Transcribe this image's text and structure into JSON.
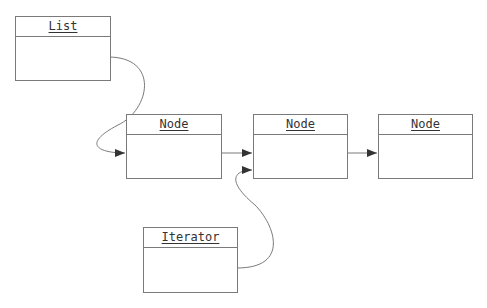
{
  "diagram": {
    "boxes": [
      {
        "id": "list",
        "title": "List"
      },
      {
        "id": "node1",
        "title": "Node"
      },
      {
        "id": "node2",
        "title": "Node"
      },
      {
        "id": "node3",
        "title": "Node"
      },
      {
        "id": "iterator",
        "title": "Iterator"
      }
    ],
    "edges": [
      {
        "from": "list",
        "to": "node1"
      },
      {
        "from": "node1",
        "to": "node2"
      },
      {
        "from": "node2",
        "to": "node3"
      },
      {
        "from": "iterator",
        "to": "node2"
      }
    ],
    "colors": {
      "line": "#7a7a7a",
      "arrow": "#333333",
      "text": "#333333"
    }
  }
}
